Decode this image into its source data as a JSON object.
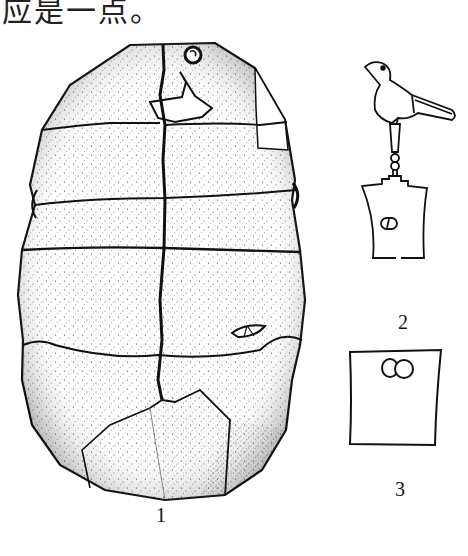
{
  "document": {
    "top_text": "应是一点。",
    "figure_labels": {
      "shell": "1",
      "bird_pendant": "2",
      "plaque": "3"
    }
  },
  "colors": {
    "ink": "#111111",
    "background": "#ffffff"
  }
}
